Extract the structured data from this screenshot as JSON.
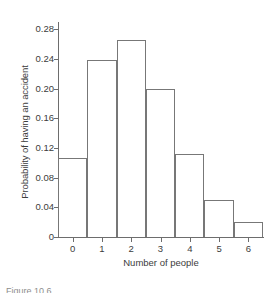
{
  "chart_data": {
    "type": "bar",
    "title": "",
    "xlabel": "Number of people",
    "ylabel": "Probability of having an accident",
    "categories": [
      "0",
      "1",
      "2",
      "3",
      "4",
      "5",
      "6"
    ],
    "values": [
      0.106,
      0.239,
      0.266,
      0.2,
      0.112,
      0.05,
      0.02
    ],
    "ylim": [
      0,
      0.29
    ],
    "xlim": [
      -0.5,
      6.5
    ],
    "yticks": [
      0,
      0.04,
      0.08,
      0.12,
      0.16,
      0.2,
      0.24,
      0.28
    ],
    "ytick_labels": [
      "0",
      "0.04",
      "0.08",
      "0.12",
      "0.16",
      "0.20",
      "0.24",
      "0.28"
    ],
    "xticks": [
      0,
      1,
      2,
      3,
      4,
      5,
      6
    ],
    "xtick_labels": [
      "0",
      "1",
      "2",
      "3",
      "4",
      "5",
      "6"
    ],
    "grid": false,
    "legend": null,
    "bar_fill": "none",
    "bar_edge_color": "#777777",
    "axis_color": "#6d6d6d",
    "background": "#ffffff",
    "spines": [
      "left",
      "bottom"
    ]
  },
  "caption": {
    "text": "Figure 10.6"
  }
}
